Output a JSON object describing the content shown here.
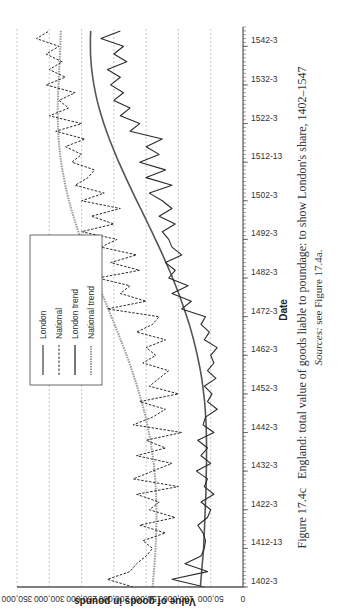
{
  "caption": {
    "figure_label": "Figure 17.4c",
    "title": "England: total value of goods liable to poundage: to show London's share, 1402–1547",
    "sources_label": "Sources:",
    "sources_text": "see Figure 17.4a."
  },
  "colors": {
    "london": "#2a2a2a",
    "national": "#2a2a2a",
    "london_trend": "#555555",
    "national_trend": "#9a9a9a",
    "grid": "#b0b0b0"
  },
  "chart_data": {
    "type": "line",
    "title": "England: total value of goods liable to poundage: to show London's share, 1402–1547",
    "xlabel": "Date",
    "ylabel": "Value of goods in pounds",
    "ylim": [
      0,
      350000
    ],
    "yticks": [
      "0",
      "50,000",
      "100,000",
      "150,000",
      "200,000",
      "250,000",
      "300,000",
      "350,000"
    ],
    "xticks": [
      "1402-3",
      "1412-13",
      "1422-3",
      "1432-3",
      "1442-3",
      "1452-3",
      "1462-3",
      "1472-3",
      "1482-3",
      "1492-3",
      "1502-3",
      "1512-13",
      "1522-3",
      "1532-3",
      "1542-3"
    ],
    "grid": "horizontal dashed",
    "legend_position": "upper left",
    "legend": [
      "London",
      "National",
      "London trend",
      "National trend"
    ],
    "x": [
      1402,
      1404,
      1406,
      1408,
      1410,
      1412,
      1414,
      1416,
      1418,
      1420,
      1422,
      1424,
      1426,
      1428,
      1430,
      1432,
      1434,
      1436,
      1438,
      1440,
      1442,
      1444,
      1446,
      1448,
      1450,
      1452,
      1454,
      1456,
      1458,
      1460,
      1462,
      1464,
      1466,
      1468,
      1470,
      1472,
      1474,
      1476,
      1478,
      1480,
      1482,
      1484,
      1486,
      1488,
      1490,
      1492,
      1494,
      1496,
      1498,
      1500,
      1502,
      1504,
      1506,
      1508,
      1510,
      1512,
      1514,
      1516,
      1518,
      1520,
      1522,
      1524,
      1526,
      1528,
      1530,
      1532,
      1534,
      1536,
      1538,
      1540,
      1542,
      1544,
      1546
    ],
    "series": [
      {
        "name": "London",
        "style": "solid",
        "values": [
          60000,
          110000,
          55000,
          90000,
          65000,
          60000,
          58000,
          62000,
          70000,
          55000,
          50000,
          65000,
          45000,
          60000,
          55000,
          72000,
          50000,
          65000,
          55000,
          70000,
          45000,
          62000,
          58000,
          40000,
          55000,
          48000,
          60000,
          42000,
          55000,
          45000,
          50000,
          40000,
          60000,
          52000,
          65000,
          58000,
          95000,
          80000,
          110000,
          85000,
          115000,
          105000,
          120000,
          95000,
          110000,
          115000,
          125000,
          105000,
          130000,
          110000,
          125000,
          145000,
          110000,
          150000,
          120000,
          160000,
          130000,
          150000,
          125000,
          175000,
          160000,
          190000,
          175000,
          200000,
          185000,
          205000,
          190000,
          210000,
          180000,
          200000,
          185000,
          220000,
          190000
        ]
      },
      {
        "name": "National",
        "style": "dashed",
        "values": [
          170000,
          210000,
          175000,
          165000,
          150000,
          140000,
          155000,
          120000,
          160000,
          105000,
          145000,
          130000,
          165000,
          100000,
          170000,
          140000,
          110000,
          165000,
          120000,
          150000,
          95000,
          170000,
          140000,
          120000,
          160000,
          100000,
          145000,
          130000,
          115000,
          155000,
          135000,
          150000,
          120000,
          165000,
          140000,
          130000,
          210000,
          150000,
          190000,
          175000,
          225000,
          160000,
          205000,
          165000,
          220000,
          195000,
          250000,
          200000,
          235000,
          190000,
          250000,
          215000,
          260000,
          240000,
          230000,
          265000,
          250000,
          275000,
          245000,
          290000,
          250000,
          300000,
          270000,
          285000,
          260000,
          305000,
          275000,
          300000,
          280000,
          305000,
          285000,
          320000,
          300000
        ]
      },
      {
        "name": "London trend",
        "style": "solid-smooth",
        "values": [
          66000,
          65000,
          64000,
          63000,
          62000,
          61000,
          60500,
          60000,
          59500,
          59000,
          58500,
          58000,
          57500,
          57200,
          57000,
          56800,
          56600,
          56500,
          56500,
          56600,
          56800,
          57200,
          57800,
          58500,
          59500,
          60800,
          62300,
          64000,
          66000,
          68300,
          70800,
          73500,
          76500,
          79700,
          83200,
          87000,
          91000,
          95200,
          99600,
          104200,
          109000,
          114000,
          119200,
          124500,
          130000,
          135600,
          141300,
          147000,
          152800,
          158600,
          164400,
          170200,
          175900,
          181500,
          187000,
          192300,
          197400,
          202300,
          207000,
          211400,
          215500,
          219300,
          222800,
          225900,
          228600,
          230900,
          232800,
          234300,
          235400,
          236100,
          236400,
          236300,
          235800
        ]
      },
      {
        "name": "National trend",
        "style": "dotted-smooth",
        "values": [
          140000,
          139000,
          138000,
          137000,
          136200,
          135500,
          134900,
          134500,
          134200,
          134000,
          134000,
          134200,
          134600,
          135200,
          136000,
          137000,
          138300,
          139800,
          141500,
          143500,
          145700,
          148200,
          150900,
          153800,
          157000,
          160400,
          164000,
          167800,
          171800,
          176000,
          180300,
          184800,
          189400,
          194100,
          198900,
          203800,
          208700,
          213600,
          218500,
          223400,
          228200,
          233000,
          237700,
          242300,
          246700,
          251000,
          255100,
          259000,
          262700,
          266200,
          269400,
          272400,
          275100,
          277500,
          279700,
          281600,
          283200,
          284500,
          285500,
          286200,
          286700,
          286900,
          286900,
          286700,
          286300,
          285800,
          285200,
          284600,
          284000,
          283400,
          282900,
          282500,
          282200
        ]
      }
    ]
  }
}
